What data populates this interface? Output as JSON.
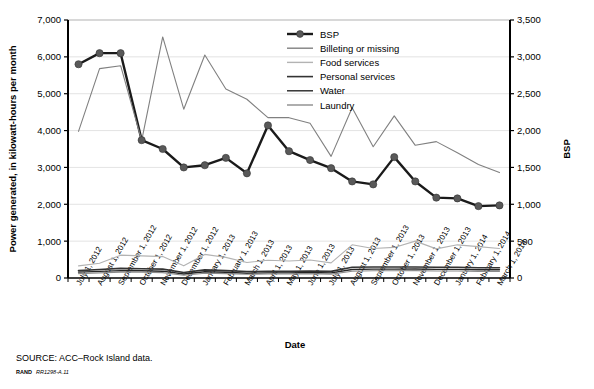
{
  "figure": {
    "source_note": "SOURCE: ACC–Rock Island data.",
    "rand_label": "RAND",
    "rand_code": "RR1298-A.11"
  },
  "chart_data": {
    "type": "line",
    "title": "",
    "xlabel": "Date",
    "ylabel": "Power generated, in kilowatt-hours per month",
    "ylabel_right": "BSP",
    "ylim": [
      0,
      7000
    ],
    "ylim_right": [
      0,
      3500
    ],
    "yticks": [
      "0",
      "1,000",
      "2,000",
      "3,000",
      "4,000",
      "5,000",
      "6,000",
      "7,000"
    ],
    "ytick_values": [
      0,
      1000,
      2000,
      3000,
      4000,
      5000,
      6000,
      7000
    ],
    "yticks_right": [
      "0",
      "500",
      "1,000",
      "1,500",
      "2,000",
      "2,500",
      "3,000",
      "3,500"
    ],
    "ytick_values_right": [
      0,
      500,
      1000,
      1500,
      2000,
      2500,
      3000,
      3500
    ],
    "grid": "horizontal",
    "legend_position": "top-center",
    "categories": [
      "July 1, 2012",
      "August 1, 2012",
      "September 1, 2012",
      "October 1, 2012",
      "November 1, 2012",
      "December 1, 2012",
      "January 1, 2013",
      "February 1, 2013",
      "March 1, 2013",
      "April 1, 2013",
      "May 1, 2013",
      "June 1, 2013",
      "July 1, 2013",
      "August 1, 2013",
      "September 1, 2013",
      "October 1, 2013",
      "November 1, 2013",
      "December 1, 2013",
      "January 1, 2014",
      "February 1, 2014",
      "March 1, 2014"
    ],
    "series": [
      {
        "name": "BSP",
        "axis": "right",
        "color": "#1a1a1a",
        "width": 2.4,
        "marker": "circle",
        "marker_color": "#595959",
        "values": [
          2900,
          3050,
          3050,
          1870,
          1750,
          1500,
          1530,
          1630,
          1420,
          2070,
          1720,
          1600,
          1490,
          1310,
          1270,
          1640,
          1310,
          1090,
          1080,
          975,
          985
        ]
      },
      {
        "name": "Billeting or missing",
        "axis": "left",
        "color": "#808080",
        "width": 1.1,
        "marker": "none",
        "values": [
          3980,
          5680,
          5760,
          3730,
          6540,
          4580,
          6050,
          5130,
          4850,
          4350,
          4350,
          4200,
          3300,
          4620,
          3560,
          4400,
          3600,
          3700,
          3400,
          3080,
          2860
        ]
      },
      {
        "name": "Food services",
        "axis": "left",
        "color": "#b3b3b3",
        "width": 1.1,
        "marker": "none",
        "values": [
          330,
          400,
          620,
          600,
          580,
          330,
          640,
          560,
          420,
          480,
          460,
          490,
          410,
          900,
          800,
          830,
          1000,
          790,
          900,
          850,
          800
        ]
      },
      {
        "name": "Personal services",
        "axis": "left",
        "color": "#333333",
        "width": 1.6,
        "marker": "none",
        "values": [
          200,
          230,
          260,
          250,
          240,
          150,
          220,
          200,
          175,
          180,
          180,
          190,
          180,
          290,
          300,
          300,
          300,
          290,
          290,
          280,
          280
        ]
      },
      {
        "name": "Water",
        "axis": "left",
        "color": "#262626",
        "width": 1.4,
        "marker": "none",
        "values": [
          160,
          180,
          200,
          195,
          185,
          110,
          170,
          155,
          130,
          140,
          140,
          150,
          140,
          230,
          240,
          240,
          245,
          235,
          235,
          225,
          225
        ]
      },
      {
        "name": "Laundry",
        "axis": "left",
        "color": "#8c8c8c",
        "width": 1.1,
        "marker": "none",
        "values": [
          120,
          140,
          160,
          155,
          145,
          75,
          130,
          120,
          100,
          110,
          110,
          115,
          105,
          185,
          195,
          195,
          200,
          190,
          190,
          180,
          180
        ]
      }
    ]
  }
}
